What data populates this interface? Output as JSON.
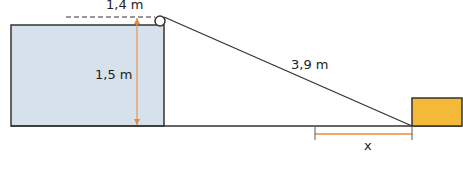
{
  "diagram": {
    "type": "physics-pulley-ramp",
    "labels": {
      "top_width": "1,4 m",
      "height": "1,5 m",
      "slope_length": "3,9 m",
      "unknown_distance": "x"
    },
    "colors": {
      "tank_fill": "#d7e1ec",
      "block_fill": "#f5b93a",
      "dimension_line": "#f08a3c",
      "outline": "#333333"
    },
    "elements": [
      {
        "name": "tank",
        "shape": "rectangle"
      },
      {
        "name": "pulley",
        "shape": "circle"
      },
      {
        "name": "rope",
        "shape": "line"
      },
      {
        "name": "block",
        "shape": "rectangle"
      },
      {
        "name": "ground",
        "shape": "line"
      }
    ]
  }
}
